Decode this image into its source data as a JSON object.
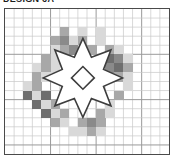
{
  "caption": {
    "text": "DESIGN 6A",
    "clipped": true
  },
  "chart": {
    "grid": {
      "columns": 18,
      "rows": 16,
      "cell_size_px": 9.1,
      "line_color": "#c9c9c9",
      "major_line_color": "#9a9a9a",
      "major_every": 5,
      "border_color": "#4a4a4a",
      "background": "#ffffff"
    },
    "palette": {
      "light": "#d9d9d9",
      "medium_light": "#c2c2c2",
      "medium": "#a8a8a8",
      "dark": "#8a8a8a",
      "darkest": "#6e6e6e",
      "outline": "#3d3d3d",
      "empty": "#ffffff"
    },
    "legend": [
      {
        "symbol": "light",
        "color": "#d9d9d9",
        "label": "Light"
      },
      {
        "symbol": "medium_light",
        "color": "#c2c2c2",
        "label": "Medium light"
      },
      {
        "symbol": "medium",
        "color": "#a8a8a8",
        "label": "Medium"
      },
      {
        "symbol": "dark",
        "color": "#8a8a8a",
        "label": "Dark"
      },
      {
        "symbol": "darkest",
        "color": "#6e6e6e",
        "label": "Darkest"
      }
    ],
    "cells": [
      {
        "c": 6,
        "r": 2,
        "shade": "medium"
      },
      {
        "c": 8,
        "r": 2,
        "shade": "light"
      },
      {
        "c": 10,
        "r": 2,
        "shade": "light"
      },
      {
        "c": 5,
        "r": 3,
        "shade": "medium"
      },
      {
        "c": 6,
        "r": 3,
        "shade": "dark"
      },
      {
        "c": 7,
        "r": 3,
        "shade": "light"
      },
      {
        "c": 8,
        "r": 3,
        "shade": "medium"
      },
      {
        "c": 10,
        "r": 3,
        "shade": "light"
      },
      {
        "c": 5,
        "r": 4,
        "shade": "light"
      },
      {
        "c": 6,
        "r": 4,
        "shade": "medium"
      },
      {
        "c": 7,
        "r": 4,
        "shade": "dark"
      },
      {
        "c": 8,
        "r": 4,
        "shade": "light"
      },
      {
        "c": 9,
        "r": 4,
        "shade": "medium"
      },
      {
        "c": 11,
        "r": 4,
        "shade": "medium"
      },
      {
        "c": 12,
        "r": 4,
        "shade": "light"
      },
      {
        "c": 4,
        "r": 5,
        "shade": "medium"
      },
      {
        "c": 5,
        "r": 5,
        "shade": "light"
      },
      {
        "c": 6,
        "r": 5,
        "shade": "medium"
      },
      {
        "c": 10,
        "r": 5,
        "shade": "medium"
      },
      {
        "c": 11,
        "r": 5,
        "shade": "darkest"
      },
      {
        "c": 12,
        "r": 5,
        "shade": "dark"
      },
      {
        "c": 13,
        "r": 5,
        "shade": "light"
      },
      {
        "c": 3,
        "r": 6,
        "shade": "light"
      },
      {
        "c": 4,
        "r": 6,
        "shade": "medium"
      },
      {
        "c": 5,
        "r": 6,
        "shade": "light"
      },
      {
        "c": 11,
        "r": 6,
        "shade": "dark"
      },
      {
        "c": 12,
        "r": 6,
        "shade": "darkest"
      },
      {
        "c": 13,
        "r": 6,
        "shade": "medium"
      },
      {
        "c": 3,
        "r": 7,
        "shade": "medium"
      },
      {
        "c": 4,
        "r": 7,
        "shade": "light"
      },
      {
        "c": 12,
        "r": 7,
        "shade": "medium"
      },
      {
        "c": 13,
        "r": 7,
        "shade": "light"
      },
      {
        "c": 2,
        "r": 8,
        "shade": "light"
      },
      {
        "c": 3,
        "r": 8,
        "shade": "medium"
      },
      {
        "c": 13,
        "r": 8,
        "shade": "light"
      },
      {
        "c": 2,
        "r": 9,
        "shade": "darkest"
      },
      {
        "c": 3,
        "r": 9,
        "shade": "light"
      },
      {
        "c": 4,
        "r": 9,
        "shade": "darkest"
      },
      {
        "c": 12,
        "r": 9,
        "shade": "medium"
      },
      {
        "c": 3,
        "r": 10,
        "shade": "darkest"
      },
      {
        "c": 4,
        "r": 10,
        "shade": "light"
      },
      {
        "c": 5,
        "r": 10,
        "shade": "medium"
      },
      {
        "c": 11,
        "r": 10,
        "shade": "light"
      },
      {
        "c": 4,
        "r": 11,
        "shade": "darkest"
      },
      {
        "c": 5,
        "r": 11,
        "shade": "light"
      },
      {
        "c": 6,
        "r": 11,
        "shade": "medium"
      },
      {
        "c": 10,
        "r": 11,
        "shade": "medium"
      },
      {
        "c": 11,
        "r": 11,
        "shade": "light"
      },
      {
        "c": 5,
        "r": 12,
        "shade": "medium"
      },
      {
        "c": 6,
        "r": 12,
        "shade": "light"
      },
      {
        "c": 8,
        "r": 12,
        "shade": "medium"
      },
      {
        "c": 9,
        "r": 12,
        "shade": "dark"
      },
      {
        "c": 10,
        "r": 12,
        "shade": "medium"
      },
      {
        "c": 7,
        "r": 13,
        "shade": "light"
      },
      {
        "c": 8,
        "r": 13,
        "shade": "light"
      },
      {
        "c": 9,
        "r": 13,
        "shade": "medium"
      },
      {
        "c": 10,
        "r": 13,
        "shade": "light"
      }
    ],
    "motif": {
      "name": "eight-pointed-star",
      "stroke_color": "#3d3d3d",
      "stroke_width": 1.6,
      "fill": "#ffffff",
      "center_diamond": true,
      "points": 8
    }
  }
}
